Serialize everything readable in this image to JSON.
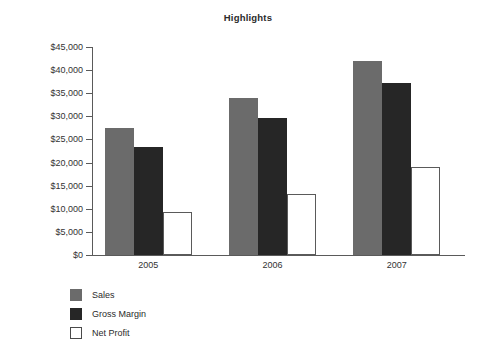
{
  "chart_data": {
    "type": "bar",
    "title": "Highlights",
    "xlabel": "",
    "ylabel": "",
    "categories": [
      "2005",
      "2006",
      "2007"
    ],
    "series": [
      {
        "name": "Sales",
        "color": "#6b6b6b",
        "values": [
          27500,
          34000,
          42000
        ]
      },
      {
        "name": "Gross Margin",
        "color": "#262626",
        "values": [
          23300,
          29600,
          37200
        ]
      },
      {
        "name": "Net Profit",
        "color": "#ffffff",
        "values": [
          9400,
          13100,
          19000
        ]
      }
    ],
    "ylim": [
      0,
      45000
    ],
    "ytick_values": [
      0,
      5000,
      10000,
      15000,
      20000,
      25000,
      30000,
      35000,
      40000,
      45000
    ],
    "ytick_labels": [
      "$0",
      "$5,000",
      "$10,000",
      "$15,000",
      "$20,000",
      "$25,000",
      "$30,000",
      "$35,000",
      "$40,000",
      "$45,000"
    ],
    "grid": false,
    "legend_position": "bottom-left"
  },
  "legend": {
    "items": [
      {
        "label": "Sales"
      },
      {
        "label": "Gross Margin"
      },
      {
        "label": "Net Profit"
      }
    ]
  }
}
